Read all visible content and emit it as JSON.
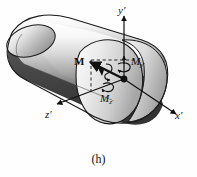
{
  "figure": {
    "caption": "(h)",
    "kind": "3d-mechanics-diagram",
    "background_color": "#fefefe",
    "line_color": "#111111"
  },
  "axes": [
    {
      "id": "y-prime",
      "label": "y′",
      "direction": "up",
      "name": "y-axis"
    },
    {
      "id": "x-prime",
      "label": "x′",
      "direction": "lower-right",
      "name": "x-axis"
    },
    {
      "id": "z-prime",
      "label": "z′",
      "direction": "lower-left",
      "name": "z-axis"
    }
  ],
  "vectors": {
    "resultant": {
      "label": "M",
      "style": "bold-upright",
      "arrow": "double-headed-curl",
      "direction": "upper-left"
    },
    "components": [
      {
        "label_base": "M",
        "label_sub": "y′",
        "axis": "y-prime",
        "arrow": "curl"
      },
      {
        "label_base": "M",
        "label_sub": "z′",
        "axis": "z-prime",
        "arrow": "curl"
      }
    ]
  },
  "body": {
    "shape": "curved-cylinder",
    "highlight_color": "#f2f2f2",
    "midtone_color": "#b8b8b8",
    "shadow_color": "#3a3a3a",
    "outline_color": "#1a1a1a",
    "cross_section": "ellipse"
  },
  "guides": {
    "style": "dashed",
    "items": [
      "horizontal-from-M-to-y-axis",
      "vertical-from-M-down-to-z-axis"
    ]
  }
}
